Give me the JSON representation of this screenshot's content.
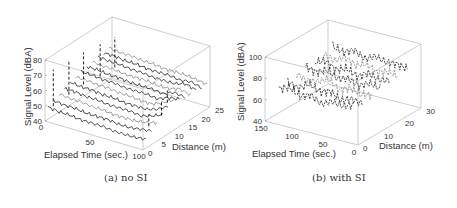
{
  "figure": {
    "captions": {
      "a": "(a) no SI",
      "b": "(b) with SI"
    }
  },
  "chart_data": [
    {
      "type": "line3d",
      "title": "(a) no SI",
      "xlabel": "Elapsed Time (sec.)",
      "ylabel": "Distance (m)",
      "zlabel": "Signal Level (dBA)",
      "x_ticks": [
        "0",
        "50",
        "100"
      ],
      "y_ticks": [
        "0",
        "5",
        "10",
        "15",
        "20",
        "25"
      ],
      "z_ticks": [
        "40",
        "50",
        "60",
        "70",
        "80"
      ],
      "xlim": [
        0,
        100
      ],
      "ylim": [
        0,
        25
      ],
      "zlim": [
        40,
        80
      ],
      "grid": false,
      "box": true,
      "series_description": "Waterfall of signal-level traces vs elapsed time, one per distance (approx 0-25 m); traces mostly 45-60 dBA with tall dashed spikes near the start (up to ~75 dBA) and a cluster of spikes near the end",
      "series": [
        {
          "name": "d=1",
          "values_dBA": [
            48,
            47,
            47,
            46,
            46,
            46,
            45,
            45,
            45,
            46
          ]
        },
        {
          "name": "d=3",
          "values_dBA": [
            50,
            49,
            49,
            48,
            48,
            48,
            47,
            47,
            48,
            49
          ]
        },
        {
          "name": "d=5",
          "values_dBA": [
            52,
            51,
            51,
            50,
            50,
            49,
            49,
            49,
            50,
            52
          ]
        },
        {
          "name": "d=7",
          "values_dBA": [
            53,
            53,
            52,
            52,
            51,
            51,
            51,
            50,
            52,
            55
          ]
        },
        {
          "name": "d=9",
          "values_dBA": [
            55,
            54,
            54,
            53,
            53,
            52,
            52,
            52,
            54,
            58
          ]
        },
        {
          "name": "d=11",
          "values_dBA": [
            56,
            56,
            55,
            55,
            54,
            54,
            53,
            53,
            56,
            60
          ]
        },
        {
          "name": "d=13",
          "values_dBA": [
            57,
            57,
            56,
            56,
            55,
            55,
            55,
            54,
            57,
            58
          ]
        },
        {
          "name": "d=15",
          "values_dBA": [
            58,
            58,
            57,
            57,
            56,
            56,
            56,
            55,
            58,
            57
          ]
        },
        {
          "name": "d=17",
          "values_dBA": [
            59,
            58,
            58,
            57,
            57,
            57,
            56,
            56,
            58,
            56
          ]
        },
        {
          "name": "d=19",
          "values_dBA": [
            60,
            59,
            59,
            58,
            58,
            57,
            57,
            57,
            59,
            57
          ]
        },
        {
          "name": "d=21",
          "values_dBA": [
            60,
            60,
            59,
            59,
            58,
            58,
            58,
            57,
            58,
            56
          ]
        },
        {
          "name": "d=23",
          "values_dBA": [
            61,
            60,
            60,
            59,
            59,
            58,
            58,
            58,
            57,
            56
          ]
        }
      ]
    },
    {
      "type": "line3d",
      "title": "(b) with SI",
      "xlabel": "Elapsed Time (sec.)",
      "ylabel": "Distance (m)",
      "zlabel": "Signal Level (dBA)",
      "x_ticks": [
        "0",
        "50",
        "100",
        "150"
      ],
      "y_ticks": [
        "0",
        "10",
        "20",
        "30"
      ],
      "z_ticks": [
        "40",
        "60",
        "80",
        "100"
      ],
      "xlim": [
        0,
        150
      ],
      "ylim": [
        0,
        30
      ],
      "zlim": [
        40,
        100
      ],
      "grid": false,
      "box": true,
      "series_description": "Dense cloud of noisy dashed traces spanning elapsed time 0-150 s and distance 0-30 m, signal levels roughly 60-85 dBA",
      "series": [
        {
          "name": "d=3",
          "values_dBA": [
            70,
            74,
            68,
            72,
            66,
            71,
            69,
            73
          ]
        },
        {
          "name": "d=7",
          "values_dBA": [
            72,
            68,
            75,
            70,
            73,
            67,
            71,
            69
          ]
        },
        {
          "name": "d=11",
          "values_dBA": [
            74,
            70,
            72,
            77,
            69,
            74,
            70,
            72
          ]
        },
        {
          "name": "d=15",
          "values_dBA": [
            76,
            73,
            78,
            72,
            75,
            71,
            76,
            73
          ]
        },
        {
          "name": "d=19",
          "values_dBA": [
            75,
            79,
            73,
            77,
            72,
            78,
            74,
            76
          ]
        },
        {
          "name": "d=23",
          "values_dBA": [
            78,
            74,
            80,
            75,
            79,
            73,
            77,
            75
          ]
        },
        {
          "name": "d=27",
          "values_dBA": [
            80,
            77,
            82,
            76,
            81,
            78,
            79,
            77
          ]
        }
      ]
    }
  ]
}
